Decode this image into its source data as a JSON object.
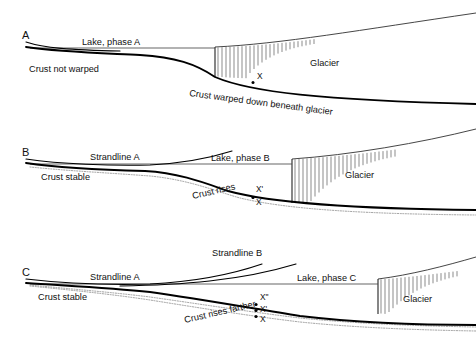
{
  "figure": {
    "width": 476,
    "height": 344,
    "background": "#ffffff",
    "ink_color": "#000000",
    "water_color": "#4a4a4a",
    "ghost_color": "#8d8d8d",
    "crevasse_color": "#5a5a5a"
  },
  "panels": [
    {
      "letter": "A",
      "labels": {
        "lake": "Lake, phase A",
        "crust_left": "Crust not warped",
        "crust_right": "Crust warped down beneath glacier",
        "glacier": "Glacier"
      },
      "markers": [
        {
          "label": "X",
          "dot": true
        }
      ]
    },
    {
      "letter": "B",
      "labels": {
        "strandline_a": "Strandline A",
        "lake": "Lake, phase B",
        "crust_left": "Crust stable",
        "crust_right": "Crust rises",
        "glacier": "Glacier"
      },
      "markers": [
        {
          "label": "X'",
          "dot": false
        },
        {
          "label": "X",
          "dot": true
        }
      ]
    },
    {
      "letter": "C",
      "labels": {
        "strandline_b": "Strandline B",
        "strandline_a": "Strandline A",
        "lake": "Lake, phase C",
        "crust_left": "Crust stable",
        "crust_right": "Crust rises farther",
        "glacier": "Glacier"
      },
      "markers": [
        {
          "label": "X\"",
          "dot": true
        },
        {
          "label": "X'",
          "dot": true
        },
        {
          "label": "X",
          "dot": true
        }
      ]
    }
  ]
}
